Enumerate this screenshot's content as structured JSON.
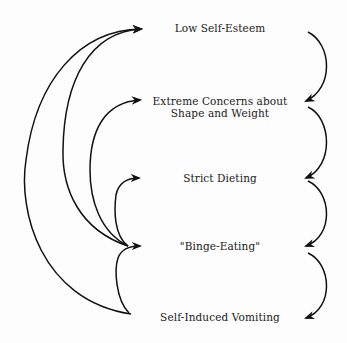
{
  "diagram": {
    "type": "cycle-flow",
    "nodes": [
      {
        "id": "low-self-esteem",
        "label": "Low Self-Esteem"
      },
      {
        "id": "extreme-concerns",
        "label_line1": "Extreme Concerns about",
        "label_line2": "Shape and Weight"
      },
      {
        "id": "strict-dieting",
        "label": "Strict Dieting"
      },
      {
        "id": "binge-eating",
        "label": "\"Binge-Eating\""
      },
      {
        "id": "self-induced-vomiting",
        "label": "Self-Induced Vomiting"
      }
    ],
    "edges": [
      {
        "from": "low-self-esteem",
        "to": "extreme-concerns",
        "side": "right"
      },
      {
        "from": "extreme-concerns",
        "to": "strict-dieting",
        "side": "right"
      },
      {
        "from": "strict-dieting",
        "to": "binge-eating",
        "side": "right"
      },
      {
        "from": "binge-eating",
        "to": "self-induced-vomiting",
        "side": "right"
      },
      {
        "from": "binge-eating",
        "to": "low-self-esteem",
        "side": "left"
      },
      {
        "from": "binge-eating",
        "to": "extreme-concerns",
        "side": "left"
      },
      {
        "from": "binge-eating",
        "to": "strict-dieting",
        "side": "left"
      },
      {
        "from": "self-induced-vomiting",
        "to": "low-self-esteem",
        "side": "left"
      },
      {
        "from": "self-induced-vomiting",
        "to": "binge-eating",
        "side": "left"
      }
    ],
    "colors": {
      "stroke": "#111111",
      "text": "#1a1a1a",
      "background": "#fdfdfd"
    }
  }
}
